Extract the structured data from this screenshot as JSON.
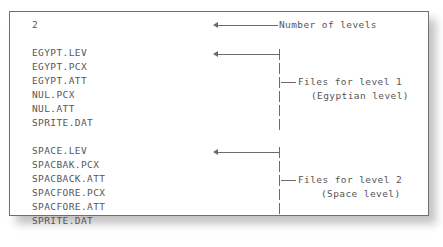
{
  "figure": {
    "header_value": "2",
    "blocks": [
      {
        "id": "level-1",
        "files": [
          "EGYPT.LEV",
          "EGYPT.PCX",
          "EGYPT.ATT",
          "NUL.PCX",
          "NUL.ATT",
          "SPRITE.DAT"
        ]
      },
      {
        "id": "level-2",
        "files": [
          "SPACE.LEV",
          "SPACBAK.PCX",
          "SPACBACK.ATT",
          "SPACFORE.PCX",
          "SPACFORE.ATT",
          "SPRITE.DAT"
        ]
      }
    ],
    "listing_text": "2\n\nEGYPT.LEV\nEGYPT.PCX\nEGYPT.ATT\nNUL.PCX\nNUL.ATT\nSPRITE.DAT\n\nSPACE.LEV\nSPACBAK.PCX\nSPACBACK.ATT\nSPACFORE.PCX\nSPACFORE.ATT\nSPRITE.DAT",
    "annotations": {
      "header": "Number of levels",
      "level1_line1": "Files for level 1",
      "level1_line2": "(Egyptian level)",
      "level2_line1": "Files for level 2",
      "level2_line2": "(Space level)"
    },
    "colors": {
      "text": "#565656",
      "rule": "#6b6b6b",
      "border": "#6f6f6f",
      "background": "#ffffff",
      "shadow": "#b9b9b9"
    }
  }
}
